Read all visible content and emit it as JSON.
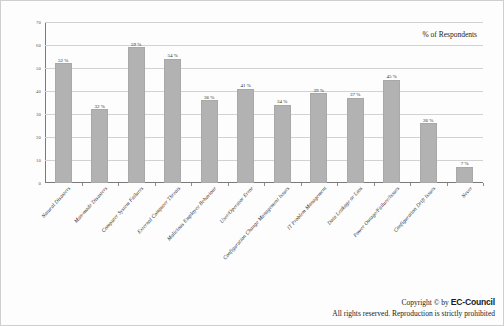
{
  "chart_data": {
    "type": "bar",
    "title": "",
    "subtitle": "",
    "annotation": "% of Respondents",
    "xlabel": "",
    "ylabel": "",
    "ylim": [
      0,
      70
    ],
    "ytick_step": 10,
    "yticks": [
      "0",
      "10",
      "20",
      "30",
      "40",
      "50",
      "60",
      "70"
    ],
    "grid": true,
    "legend": false,
    "categories": [
      "Natural Disasters",
      "Man-made Disasters",
      "Computer System Failures",
      "External Computer Threats",
      "Malicious Employee Behaviour",
      "User/Operator Error",
      "Configuration Change Management Issues",
      "IT Problem Management",
      "Data Leakage or Loss",
      "Power Outage/Failure/Issues",
      "Configuration Drift Issues",
      "Never"
    ],
    "values": [
      52,
      32,
      59,
      54,
      36,
      41,
      34,
      39,
      37,
      45,
      26,
      7
    ],
    "value_labels": [
      "52 %",
      "32 %",
      "59 %",
      "54 %",
      "36 %",
      "41 %",
      "34 %",
      "39 %",
      "37 %",
      "45 %",
      "26 %",
      "7 %"
    ],
    "bar_color": "#b2b2b2",
    "grid_color": "#d2d2d2",
    "axis_color": "#7a7a7a"
  },
  "footer": {
    "copyright_prefix": "Copyright © by ",
    "brand": "EC-Council",
    "rights": "All rights reserved. Reproduction is strictly prohibited"
  }
}
